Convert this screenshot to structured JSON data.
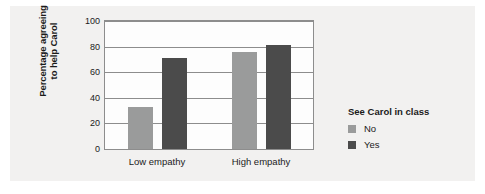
{
  "chart_data": {
    "type": "bar",
    "title": "",
    "subtitle": "",
    "xlabel": "",
    "ylabel_line1": "Percentage agreeing",
    "ylabel_line2": "to help Carol",
    "ylabel": "Percentage agreeing to help Carol",
    "categories": [
      "Low empathy",
      "High empathy"
    ],
    "series": [
      {
        "name": "No",
        "color": "#9a9b9b",
        "values": [
          33,
          76
        ]
      },
      {
        "name": "Yes",
        "color": "#4b4b4b",
        "values": [
          71,
          81
        ]
      }
    ],
    "ylim": [
      0,
      100
    ],
    "yticks": [
      0,
      20,
      40,
      60,
      80,
      100
    ],
    "ytick_labels": [
      "0",
      "20",
      "40",
      "60",
      "80",
      "100"
    ],
    "grid": "horizontal",
    "legend_position": "right",
    "legend_title": "See Carol in class",
    "background_color": "#f2f1f0",
    "plot_background_color": "#fdfdfd",
    "axis_color": "#8d8d8d",
    "text_color": "#1b1b1b"
  }
}
